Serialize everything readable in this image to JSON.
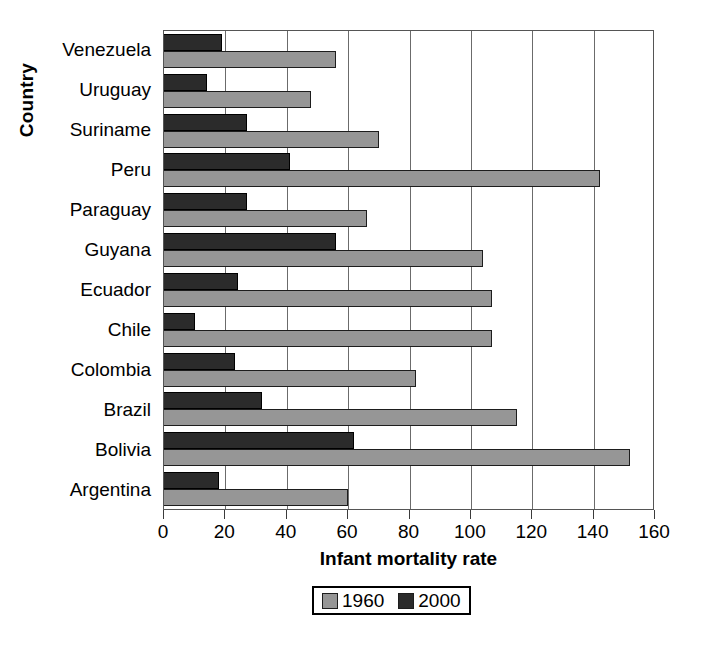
{
  "chart_data": {
    "type": "bar",
    "orientation": "horizontal",
    "title": "",
    "xlabel": "Infant mortality rate",
    "ylabel": "Country",
    "xlim": [
      0,
      160
    ],
    "xticks": [
      0,
      20,
      40,
      60,
      80,
      100,
      120,
      140,
      160
    ],
    "grid": true,
    "legend_position": "bottom-center",
    "categories": [
      "Venezuela",
      "Uruguay",
      "Suriname",
      "Peru",
      "Paraguay",
      "Guyana",
      "Ecuador",
      "Chile",
      "Colombia",
      "Brazil",
      "Bolivia",
      "Argentina"
    ],
    "series": [
      {
        "name": "1960",
        "color": "#969696",
        "values": [
          56,
          48,
          70,
          142,
          66,
          104,
          107,
          107,
          82,
          115,
          152,
          60
        ]
      },
      {
        "name": "2000",
        "color": "#2b2b2b",
        "values": [
          19,
          14,
          27,
          41,
          27,
          56,
          24,
          10,
          23,
          32,
          62,
          18
        ]
      }
    ]
  },
  "legend": {
    "items": [
      {
        "label": "1960",
        "swatch": "gray-swatch"
      },
      {
        "label": "2000",
        "swatch": "dark-swatch"
      }
    ]
  }
}
